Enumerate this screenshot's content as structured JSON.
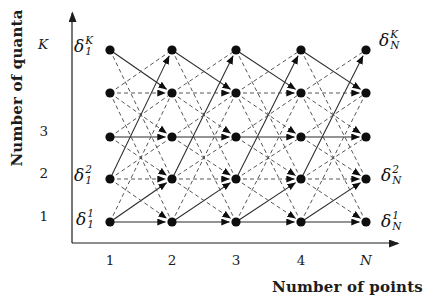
{
  "figure": {
    "background": "#ffffff",
    "ink_color": "#1c1c1c",
    "solid_edge_color": "#2a2a2a",
    "dashed_edge_color": "#4d4d4d",
    "node_color": "#0e0e0e",
    "x_axis": {
      "title": "Number of points",
      "ticks": [
        "1",
        "2",
        "3",
        "4",
        "N"
      ],
      "line": {
        "x1": 72,
        "y1": 243,
        "x2": 398,
        "y2": 243
      },
      "tick_baseline_y": 265
    },
    "y_axis": {
      "title": "Number of quanta",
      "ticks": [
        {
          "label": "1",
          "row": 1,
          "italic": false
        },
        {
          "label": "2",
          "row": 2,
          "italic": false
        },
        {
          "label": "3",
          "row": 3,
          "italic": false
        },
        {
          "label": "K",
          "row": 5,
          "italic": true
        }
      ],
      "line": {
        "x1": 72,
        "y1": 243,
        "x2": 72,
        "y2": 13
      },
      "label_right_x": 48
    },
    "grid": {
      "col_x": [
        110,
        172,
        236,
        301,
        366
      ],
      "row_y": [
        222,
        179,
        137,
        93,
        50
      ],
      "node_radius": 4.6
    },
    "node_labels": [
      {
        "id": "delta-1-K",
        "base": "δ",
        "sup": "K",
        "sub": "1",
        "x": 74,
        "y": 38
      },
      {
        "id": "delta-1-2",
        "base": "δ",
        "sup": "2",
        "sub": "1",
        "x": 74,
        "y": 167
      },
      {
        "id": "delta-1-1",
        "base": "δ",
        "sup": "1",
        "sub": "1",
        "x": 76,
        "y": 211
      },
      {
        "id": "delta-N-K",
        "base": "δ",
        "sup": "K",
        "sub": "N",
        "x": 379,
        "y": 32
      },
      {
        "id": "delta-N-2",
        "base": "δ",
        "sup": "2",
        "sub": "N",
        "x": 381,
        "y": 167
      },
      {
        "id": "delta-N-1",
        "base": "δ",
        "sup": "1",
        "sub": "N",
        "x": 381,
        "y": 213
      }
    ],
    "edges_per_gap": [
      {
        "from": 1,
        "to": 1,
        "style": "solid",
        "arrow": true
      },
      {
        "from": 3,
        "to": 3,
        "style": "solid",
        "arrow": true
      },
      {
        "from": 5,
        "to": 4,
        "style": "solid",
        "arrow": true
      },
      {
        "from": 1,
        "to": 2,
        "style": "solid",
        "arrow": true
      },
      {
        "from": 2,
        "to": 5,
        "style": "solid",
        "arrow": true
      },
      {
        "from": 2,
        "to": 2,
        "style": "dashed",
        "arrow": true
      },
      {
        "from": 4,
        "to": 4,
        "style": "dashed",
        "arrow": true
      },
      {
        "from": 2,
        "to": 1,
        "style": "dashed",
        "arrow": true
      },
      {
        "from": 3,
        "to": 2,
        "style": "dashed",
        "arrow": true
      },
      {
        "from": 4,
        "to": 3,
        "style": "dashed",
        "arrow": true
      },
      {
        "from": 2,
        "to": 3,
        "style": "dashed",
        "arrow": false
      },
      {
        "from": 3,
        "to": 4,
        "style": "dashed",
        "arrow": false
      },
      {
        "from": 4,
        "to": 5,
        "style": "dashed",
        "arrow": false
      },
      {
        "from": 5,
        "to": 2,
        "style": "dashed",
        "arrow": false
      },
      {
        "from": 4,
        "to": 1,
        "style": "dashed",
        "arrow": false
      },
      {
        "from": 1,
        "to": 4,
        "style": "dashed",
        "arrow": false
      }
    ]
  }
}
